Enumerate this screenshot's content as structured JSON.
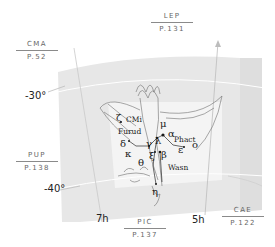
{
  "chart": {
    "constellation": "Columba",
    "neighbors": [
      {
        "abbr": "CMA",
        "page": "P.52"
      },
      {
        "abbr": "LEP",
        "page": "P.131"
      },
      {
        "abbr": "PUP",
        "page": "P.138"
      },
      {
        "abbr": "PIC",
        "page": "P.137"
      },
      {
        "abbr": "CAE",
        "page": "P.122"
      }
    ],
    "declination_labels": [
      "-30°",
      "-40°"
    ],
    "ra_labels": [
      "7h",
      "5h"
    ],
    "star_labels": {
      "zeta": "ζ",
      "mu": "μ",
      "alpha": "α",
      "delta": "δ",
      "gamma": "γ",
      "lambda": "λ",
      "epsilon": "ε",
      "omicron": "o",
      "kappa": "κ",
      "xi": "ξ",
      "beta": "β",
      "theta": "θ",
      "eta": "η"
    },
    "star_names": {
      "cmi": "CMi",
      "furud": "Furud",
      "phact": "Phact",
      "wasn": "Wasn"
    },
    "colors": {
      "panel": "#e6e6e6",
      "inner_panel": "#f3f3f3",
      "grid": "#c8c8c8",
      "text": "#222222"
    }
  }
}
